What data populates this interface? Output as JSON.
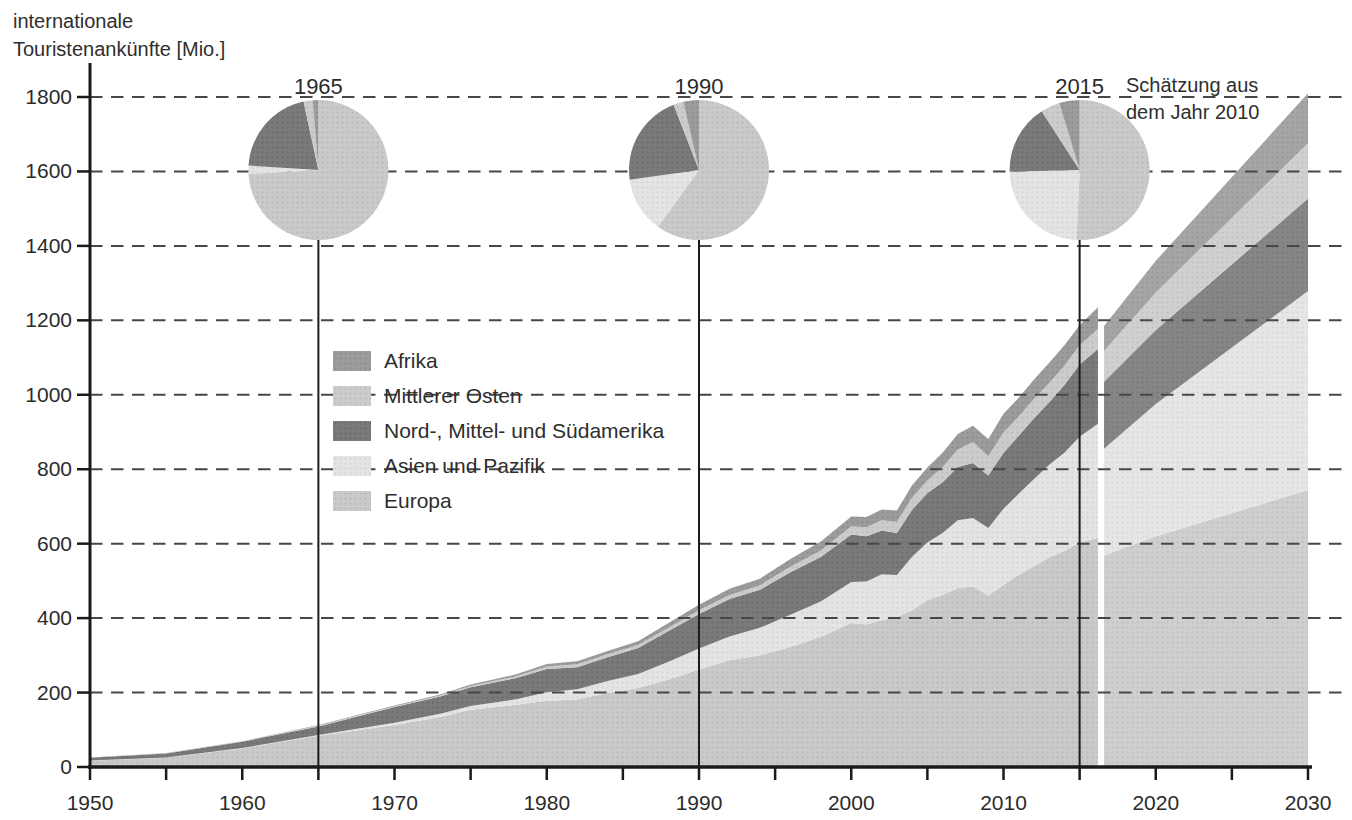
{
  "page": {
    "title_line1": "internationale",
    "title_line2": "Touristenankünfte [Mio.]",
    "annotation_line1": "Schätzung aus",
    "annotation_line2": "dem Jahr 2010"
  },
  "chart_data": {
    "type": "area",
    "title": "internationale Touristenankünfte [Mio.]",
    "xlabel": "",
    "ylabel": "internationale Touristenankünfte [Mio.]",
    "unit": "Mio.",
    "xlim": [
      1950,
      2030
    ],
    "ylim": [
      0,
      1800
    ],
    "y_tick_step": 200,
    "x_tick_step": 5,
    "x_label_step": 10,
    "grid": "dashed horizontal",
    "milestone_years": [
      1965,
      1990,
      2015
    ],
    "annotation": "Schätzung aus dem Jahr 2010",
    "stack_order_bottom_to_top": [
      "europa",
      "asien",
      "amerika",
      "mittlerer_osten",
      "afrika"
    ],
    "regions": [
      {
        "key": "afrika",
        "label": "Afrika",
        "color": "#9c9c9c"
      },
      {
        "key": "mittlerer_osten",
        "label": "Mittlerer Osten",
        "color": "#cccccc"
      },
      {
        "key": "amerika",
        "label": "Nord-, Mittel- und Südamerika",
        "color": "#7a7a7a"
      },
      {
        "key": "asien",
        "label": "Asien und Pazifik",
        "color": "#e4e4e4"
      },
      {
        "key": "europa",
        "label": "Europa",
        "color": "#cacaca"
      }
    ],
    "actual": {
      "years": [
        1950,
        1955,
        1960,
        1965,
        1970,
        1973,
        1975,
        1978,
        1980,
        1982,
        1984,
        1986,
        1988,
        1990,
        1992,
        1994,
        1996,
        1998,
        2000,
        2001,
        2002,
        2003,
        2004,
        2005,
        2006,
        2007,
        2008,
        2009,
        2010,
        2011,
        2012,
        2013,
        2014,
        2015,
        2016.2
      ],
      "series": {
        "europa": [
          17,
          25,
          50,
          84,
          113,
          134,
          154,
          167,
          178,
          181,
          199,
          212,
          235,
          262,
          287,
          300,
          322,
          350,
          387,
          383,
          394,
          403,
          421,
          449,
          462,
          481,
          485,
          461,
          489,
          516,
          540,
          563,
          580,
          603,
          616
        ],
        "asien": [
          0.2,
          0.5,
          0.9,
          2,
          6,
          9,
          10,
          15,
          23,
          28,
          32,
          38,
          48,
          56,
          64,
          74,
          87,
          95,
          110,
          115,
          124,
          113,
          144,
          154,
          167,
          182,
          184,
          181,
          205,
          218,
          234,
          249,
          264,
          284,
          306
        ],
        "amerika": [
          7.5,
          11,
          17,
          23,
          42,
          46,
          50,
          57,
          62,
          59,
          64,
          70,
          82,
          93,
          100,
          102,
          114,
          119,
          128,
          122,
          117,
          113,
          126,
          133,
          136,
          143,
          148,
          141,
          150,
          156,
          163,
          168,
          182,
          194,
          201
        ],
        "mittlerer_osten": [
          0.2,
          0.4,
          0.6,
          2.4,
          2,
          3,
          4,
          5,
          7,
          8,
          8,
          8,
          9,
          10,
          11,
          12,
          15,
          18,
          22,
          24,
          28,
          29,
          33,
          34,
          41,
          47,
          56,
          52,
          55,
          52,
          52,
          52,
          52,
          52,
          54
        ],
        "afrika": [
          0.5,
          0.7,
          0.8,
          1.4,
          2.4,
          3,
          4,
          5,
          7,
          8,
          9,
          10,
          13,
          15,
          17,
          18,
          21,
          24,
          26,
          28,
          29,
          31,
          33,
          35,
          38,
          42,
          44,
          46,
          50,
          50,
          52,
          54,
          55,
          54,
          58
        ]
      }
    },
    "estimate": {
      "years": [
        2016.6,
        2020,
        2030
      ],
      "series": {
        "europa": [
          568,
          620,
          744
        ],
        "asien": [
          287,
          355,
          535
        ],
        "amerika": [
          180,
          199,
          248
        ],
        "mittlerer_osten": [
          83,
          101,
          149
        ],
        "afrika": [
          67,
          85,
          134
        ]
      }
    },
    "pies": [
      {
        "label": "1965",
        "year": 1965,
        "shares": {
          "europa": 74.1,
          "asien": 1.9,
          "amerika": 20.6,
          "mittlerer_osten": 2.1,
          "afrika": 1.3
        }
      },
      {
        "label": "1990",
        "year": 1990,
        "shares": {
          "europa": 60.0,
          "asien": 12.8,
          "amerika": 21.3,
          "mittlerer_osten": 2.3,
          "afrika": 3.6
        }
      },
      {
        "label": "2015",
        "year": 2015,
        "shares": {
          "europa": 50.7,
          "asien": 23.9,
          "amerika": 16.3,
          "mittlerer_osten": 4.4,
          "afrika": 4.7
        }
      }
    ]
  }
}
